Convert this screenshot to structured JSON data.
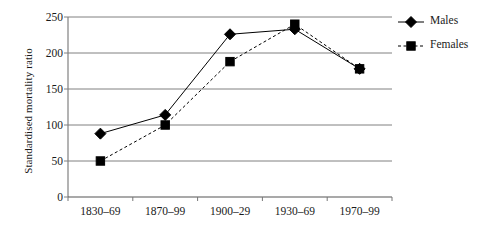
{
  "chart_data": {
    "type": "line",
    "title": "",
    "xlabel": "",
    "ylabel": "Standardised mortality ratio",
    "categories": [
      "1830–69",
      "1870–99",
      "1900–29",
      "1930–69",
      "1970–99"
    ],
    "series": [
      {
        "name": "Males",
        "marker": "diamond",
        "linestyle": "solid",
        "color": "#000000",
        "values": [
          88,
          114,
          226,
          233,
          178
        ]
      },
      {
        "name": "Females",
        "marker": "square",
        "linestyle": "dashed",
        "color": "#000000",
        "values": [
          50,
          100,
          188,
          240,
          178
        ]
      }
    ],
    "ylim": [
      0,
      250
    ],
    "yticks": [
      0,
      50,
      100,
      150,
      200,
      250
    ],
    "ytick_labels": [
      "0",
      "50",
      "100",
      "150",
      "200",
      "250"
    ],
    "grid": "horizontal",
    "legend_position": "right",
    "legend_entries": [
      "Males",
      "Females"
    ],
    "axis_color": "#808080",
    "background": "#ffffff"
  }
}
